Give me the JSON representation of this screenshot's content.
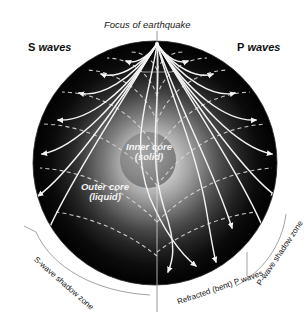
{
  "diagram": {
    "background_color": "#ffffff",
    "labels": {
      "focus": "Focus of earthquake",
      "s_waves_letter": "S",
      "s_waves_word": "waves",
      "p_waves_letter": "P",
      "p_waves_word": "waves",
      "inner_core_line1": "Inner core",
      "inner_core_line2": "(solid)",
      "outer_core_line1": "Outer core",
      "outer_core_line2": "(liquid)",
      "s_shadow_zone": "S-wave shadow zone",
      "refracted_p_waves": "Refracted (bent) P waves",
      "p_shadow_zone": "P-wave shadow zone"
    },
    "colors": {
      "page_background": "#ffffff",
      "mantle_outer": "#050505",
      "mantle_mid": "#3a3a3a",
      "outer_core": "#b9b9b9",
      "inner_core": "#8d8d8d",
      "ray_stroke": "#f2f2f2",
      "wavefront_stroke": "#d8d8d8",
      "leader_stroke": "#8a8a8a",
      "text_dark": "#141414",
      "text_light": "#f4f4f4"
    },
    "geometry": {
      "sphere_center_x": 155,
      "sphere_center_y": 163,
      "sphere_radius": 122,
      "focus_x": 157,
      "focus_y": 44,
      "inner_core_center_x": 148,
      "inner_core_center_y": 160,
      "inner_core_radius": 28,
      "outer_core_radius": 62
    },
    "elements": {
      "ray_count_s_side": 7,
      "ray_count_p_side": 7,
      "wavefront_arc_count": 6,
      "arrowheads": "surface terminations of each ray"
    }
  }
}
